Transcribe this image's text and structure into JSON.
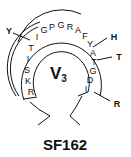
{
  "diagram": {
    "loop_label": "V",
    "loop_subscript": "3",
    "strain_label": "SF162",
    "residues": [
      {
        "letter": "R",
        "x": 31,
        "y": 92
      },
      {
        "letter": "K",
        "x": 28,
        "y": 81
      },
      {
        "letter": "S",
        "x": 27,
        "y": 70
      },
      {
        "letter": "I",
        "x": 28,
        "y": 59
      },
      {
        "letter": "T",
        "x": 31,
        "y": 48
      },
      {
        "letter": "I",
        "x": 37,
        "y": 37
      },
      {
        "letter": "G",
        "x": 44,
        "y": 30
      },
      {
        "letter": "P",
        "x": 52,
        "y": 27
      },
      {
        "letter": "G",
        "x": 61,
        "y": 25
      },
      {
        "letter": "R",
        "x": 70,
        "y": 27
      },
      {
        "letter": "A",
        "x": 78,
        "y": 30
      },
      {
        "letter": "F",
        "x": 85,
        "y": 36
      },
      {
        "letter": "Y",
        "x": 90,
        "y": 44
      },
      {
        "letter": "A",
        "x": 93,
        "y": 53
      },
      {
        "letter": "T",
        "x": 94,
        "y": 62
      },
      {
        "letter": "G",
        "x": 93,
        "y": 71
      },
      {
        "letter": "D",
        "x": 90,
        "y": 80
      },
      {
        "letter": "I",
        "x": 86,
        "y": 89
      }
    ],
    "annotations": [
      {
        "label": "Y",
        "x": 9,
        "y": 31,
        "line": [
          13,
          33,
          30,
          40
        ]
      },
      {
        "label": "H",
        "x": 114,
        "y": 37,
        "line": [
          93,
          47,
          107,
          38
        ]
      },
      {
        "label": "T",
        "x": 119,
        "y": 57,
        "line": [
          97,
          60,
          112,
          57
        ]
      },
      {
        "label": "R",
        "x": 117,
        "y": 104,
        "line": [
          94,
          92,
          110,
          101
        ]
      }
    ]
  }
}
